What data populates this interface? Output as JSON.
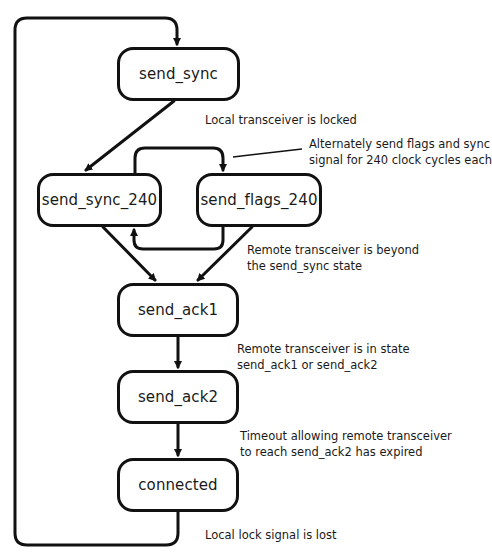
{
  "diagram": {
    "type": "state-machine",
    "states": [
      {
        "id": "send_sync",
        "label": "send_sync"
      },
      {
        "id": "send_sync_240",
        "label": "send_sync_240"
      },
      {
        "id": "send_flags_240",
        "label": "send_flags_240"
      },
      {
        "id": "send_ack1",
        "label": "send_ack1"
      },
      {
        "id": "send_ack2",
        "label": "send_ack2"
      },
      {
        "id": "connected",
        "label": "connected"
      }
    ],
    "transitions": [
      {
        "from": "send_sync",
        "to": "send_sync_240",
        "condition": "Local transceiver is locked"
      },
      {
        "from": "send_sync_240",
        "to": "send_flags_240",
        "condition": "Alternately send flags and sync signal for 240 clock cycles each"
      },
      {
        "from": "send_flags_240",
        "to": "send_sync_240",
        "condition": ""
      },
      {
        "from": "send_sync_240",
        "to": "send_ack1",
        "condition": "Remote transceiver is beyond the send_sync state"
      },
      {
        "from": "send_flags_240",
        "to": "send_ack1",
        "condition": "Remote transceiver is beyond the send_sync state"
      },
      {
        "from": "send_ack1",
        "to": "send_ack2",
        "condition": "Remote transceiver is in state send_ack1 or send_ack2"
      },
      {
        "from": "send_ack2",
        "to": "connected",
        "condition": "Timeout allowing remote transceiver to reach send_ack2 has expired"
      },
      {
        "from": "connected",
        "to": "send_sync",
        "condition": "Local lock signal is lost"
      }
    ],
    "labels": {
      "locked": "Local transceiver is locked",
      "alternate_line1": "Alternately send flags and sync",
      "alternate_line2": "signal for 240 clock cycles each",
      "beyond_line1": "Remote transceiver is beyond",
      "beyond_line2": "the send_sync state",
      "in_state_line1": "Remote transceiver is in state",
      "in_state_line2": "send_ack1 or send_ack2",
      "timeout_line1": "Timeout allowing remote transceiver",
      "timeout_line2": "to reach send_ack2 has expired",
      "lock_lost": "Local lock signal is lost"
    }
  }
}
